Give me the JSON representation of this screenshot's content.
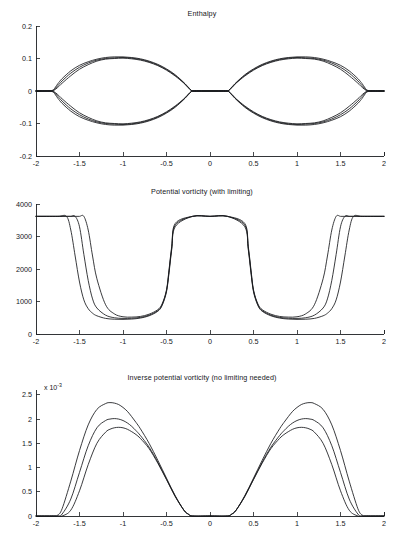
{
  "figure": {
    "background_color": "#ffffff",
    "line_color": "#16181b",
    "axis_color": "#1d1f22"
  },
  "panels": [
    {
      "id": "enthalpy",
      "title": "Enthalpy",
      "exponent_label": ""
    },
    {
      "id": "potential-vorticity",
      "title": "Potential vorticity (with limiting)",
      "exponent_label": ""
    },
    {
      "id": "inverse-potential-vorticity",
      "title": "Inverse potential vorticity (no limiting needed)",
      "exponent_label_prefix": "x 10",
      "exponent_label_sup": "-3"
    }
  ],
  "chart_data": [
    {
      "type": "line",
      "title": "Enthalpy",
      "xlabel": "",
      "ylabel": "",
      "xlim": [
        -2,
        2
      ],
      "ylim": [
        -0.2,
        0.2
      ],
      "xticks": [
        -2,
        -1.5,
        -1,
        -0.5,
        0,
        0.5,
        1,
        1.5,
        2
      ],
      "xticklabels": [
        "-2",
        "-1.5",
        "-1",
        "-0.5",
        "0",
        "0.5",
        "1",
        "1.5",
        "2"
      ],
      "yticks": [
        -0.2,
        -0.1,
        0,
        0.1,
        0.2
      ],
      "yticklabels": [
        "-0.2",
        "-0.1",
        "0",
        "0.1",
        "0.2"
      ],
      "grid": false,
      "legend": "none",
      "x": [
        -2,
        -1.9,
        -1.85,
        -1.8,
        -1.75,
        -1.7,
        -1.6,
        -1.5,
        -1.4,
        -1.3,
        -1.2,
        -1.1,
        -1,
        -0.9,
        -0.8,
        -0.7,
        -0.6,
        -0.5,
        -0.4,
        -0.3,
        -0.25,
        -0.2,
        -0.1,
        0,
        0.1,
        0.2,
        0.25,
        0.3,
        0.4,
        0.5,
        0.6,
        0.7,
        0.8,
        0.9,
        1,
        1.1,
        1.2,
        1.3,
        1.4,
        1.5,
        1.6,
        1.7,
        1.75,
        1.8,
        1.85,
        1.9,
        2
      ],
      "series": [
        {
          "name": "upper-branch-1",
          "values": [
            0,
            0,
            0,
            0.004,
            0.022,
            0.038,
            0.062,
            0.079,
            0.09,
            0.098,
            0.103,
            0.105,
            0.105,
            0.103,
            0.099,
            0.092,
            0.082,
            0.068,
            0.05,
            0.026,
            0.012,
            0,
            0,
            0,
            0,
            0,
            0.012,
            0.026,
            0.05,
            0.068,
            0.082,
            0.092,
            0.099,
            0.103,
            0.105,
            0.105,
            0.103,
            0.098,
            0.09,
            0.079,
            0.062,
            0.038,
            0.022,
            0.004,
            0,
            0,
            0
          ]
        },
        {
          "name": "upper-branch-2",
          "values": [
            0,
            0,
            0,
            0.002,
            0.016,
            0.031,
            0.055,
            0.073,
            0.086,
            0.095,
            0.1,
            0.102,
            0.103,
            0.101,
            0.097,
            0.09,
            0.08,
            0.066,
            0.048,
            0.025,
            0.011,
            0,
            0,
            0,
            0,
            0,
            0.011,
            0.025,
            0.048,
            0.066,
            0.08,
            0.09,
            0.097,
            0.101,
            0.103,
            0.102,
            0.1,
            0.095,
            0.086,
            0.073,
            0.055,
            0.031,
            0.016,
            0.002,
            0,
            0,
            0
          ]
        },
        {
          "name": "upper-branch-3",
          "values": [
            0,
            0,
            0,
            0.001,
            0.011,
            0.024,
            0.047,
            0.067,
            0.081,
            0.092,
            0.098,
            0.1,
            0.101,
            0.099,
            0.095,
            0.088,
            0.078,
            0.064,
            0.046,
            0.024,
            0.01,
            0,
            0,
            0,
            0,
            0,
            0.01,
            0.024,
            0.046,
            0.064,
            0.078,
            0.088,
            0.095,
            0.099,
            0.101,
            0.1,
            0.098,
            0.092,
            0.081,
            0.067,
            0.047,
            0.024,
            0.011,
            0.001,
            0,
            0,
            0
          ]
        },
        {
          "name": "lower-branch-1",
          "values": [
            0,
            0,
            0,
            -0.004,
            -0.022,
            -0.038,
            -0.062,
            -0.079,
            -0.09,
            -0.098,
            -0.103,
            -0.105,
            -0.105,
            -0.103,
            -0.099,
            -0.092,
            -0.082,
            -0.068,
            -0.05,
            -0.026,
            -0.012,
            0,
            0,
            0,
            0,
            0,
            -0.012,
            -0.026,
            -0.05,
            -0.068,
            -0.082,
            -0.092,
            -0.099,
            -0.103,
            -0.105,
            -0.105,
            -0.103,
            -0.098,
            -0.09,
            -0.079,
            -0.062,
            -0.038,
            -0.022,
            -0.004,
            0,
            0,
            0
          ]
        },
        {
          "name": "lower-branch-2",
          "values": [
            0,
            0,
            0,
            -0.002,
            -0.016,
            -0.031,
            -0.055,
            -0.073,
            -0.086,
            -0.095,
            -0.1,
            -0.102,
            -0.103,
            -0.101,
            -0.097,
            -0.09,
            -0.08,
            -0.066,
            -0.048,
            -0.025,
            -0.011,
            0,
            0,
            0,
            0,
            0,
            -0.011,
            -0.025,
            -0.048,
            -0.066,
            -0.08,
            -0.09,
            -0.097,
            -0.101,
            -0.103,
            -0.102,
            -0.1,
            -0.095,
            -0.086,
            -0.073,
            -0.055,
            -0.031,
            -0.016,
            -0.002,
            0,
            0,
            0
          ]
        },
        {
          "name": "lower-branch-3",
          "values": [
            0,
            0,
            0,
            -0.001,
            -0.011,
            -0.024,
            -0.047,
            -0.067,
            -0.081,
            -0.092,
            -0.098,
            -0.1,
            -0.101,
            -0.099,
            -0.095,
            -0.088,
            -0.078,
            -0.064,
            -0.046,
            -0.024,
            -0.01,
            0,
            0,
            0,
            0,
            0,
            -0.01,
            -0.024,
            -0.046,
            -0.064,
            -0.078,
            -0.088,
            -0.095,
            -0.099,
            -0.101,
            -0.1,
            -0.098,
            -0.092,
            -0.081,
            -0.067,
            -0.047,
            -0.024,
            -0.011,
            -0.001,
            0,
            0,
            0
          ]
        }
      ]
    },
    {
      "type": "line",
      "title": "Potential vorticity (with limiting)",
      "xlabel": "",
      "ylabel": "",
      "xlim": [
        -2,
        2
      ],
      "ylim": [
        0,
        4000
      ],
      "xticks": [
        -2,
        -1.5,
        -1,
        -0.5,
        0,
        0.5,
        1,
        1.5,
        2
      ],
      "xticklabels": [
        "-2",
        "-1.5",
        "-1",
        "-0.5",
        "0",
        "0.5",
        "1",
        "1.5",
        "2"
      ],
      "yticks": [
        0,
        1000,
        2000,
        3000,
        4000
      ],
      "yticklabels": [
        "0",
        "1000",
        "2000",
        "3000",
        "4000"
      ],
      "grid": false,
      "legend": "none",
      "limit_value": 3620,
      "x": [
        -2,
        -1.75,
        -1.65,
        -1.6,
        -1.55,
        -1.5,
        -1.45,
        -1.4,
        -1.35,
        -1.3,
        -1.2,
        -1.1,
        -1,
        -0.9,
        -0.8,
        -0.7,
        -0.6,
        -0.55,
        -0.5,
        -0.47,
        -0.44,
        -0.4,
        -0.2,
        0,
        0.2,
        0.4,
        0.44,
        0.47,
        0.5,
        0.55,
        0.6,
        0.7,
        0.8,
        0.9,
        1,
        1.1,
        1.2,
        1.3,
        1.35,
        1.4,
        1.45,
        1.5,
        1.55,
        1.6,
        1.65,
        1.75,
        2
      ],
      "series": [
        {
          "name": "pv-curve-1",
          "values": [
            3620,
            3620,
            3620,
            3200,
            2400,
            1600,
            1050,
            780,
            640,
            560,
            480,
            455,
            450,
            460,
            490,
            560,
            700,
            880,
            1300,
            1900,
            2600,
            3300,
            3620,
            3620,
            3620,
            3300,
            2600,
            1900,
            1300,
            880,
            700,
            560,
            490,
            460,
            450,
            455,
            480,
            560,
            640,
            780,
            1050,
            1600,
            2400,
            3200,
            3620,
            3620,
            3620
          ]
        },
        {
          "name": "pv-curve-2",
          "values": [
            3620,
            3620,
            3620,
            3620,
            3620,
            3300,
            2450,
            1650,
            1080,
            800,
            580,
            500,
            480,
            485,
            510,
            580,
            720,
            900,
            1330,
            1950,
            2650,
            3350,
            3620,
            3620,
            3620,
            3350,
            2650,
            1950,
            1330,
            900,
            720,
            580,
            510,
            485,
            480,
            500,
            580,
            800,
            1080,
            1650,
            2450,
            3300,
            3620,
            3620,
            3620,
            3620,
            3620
          ]
        },
        {
          "name": "pv-curve-3",
          "values": [
            3620,
            3620,
            3620,
            3620,
            3620,
            3620,
            3620,
            3200,
            2400,
            1700,
            900,
            620,
            530,
            520,
            540,
            610,
            750,
            930,
            1360,
            2000,
            2700,
            3400,
            3620,
            3620,
            3620,
            3400,
            2700,
            2000,
            1360,
            930,
            750,
            610,
            540,
            520,
            530,
            620,
            900,
            1700,
            2400,
            3200,
            3620,
            3620,
            3620,
            3620,
            3620,
            3620,
            3620
          ]
        }
      ]
    },
    {
      "type": "line",
      "title": "Inverse potential vorticity (no limiting needed)",
      "xlabel": "",
      "ylabel": "",
      "y_multiplier": "x 10^-3",
      "xlim": [
        -2,
        2
      ],
      "ylim": [
        0,
        2.6
      ],
      "xticks": [
        -2,
        -1.5,
        -1,
        -0.5,
        0,
        0.5,
        1,
        1.5,
        2
      ],
      "xticklabels": [
        "-2",
        "-1.5",
        "-1",
        "-0.5",
        "0",
        "0.5",
        "1",
        "1.5",
        "2"
      ],
      "yticks": [
        0,
        0.5,
        1,
        1.5,
        2,
        2.5
      ],
      "yticklabels": [
        "0",
        "0.5",
        "1",
        "1.5",
        "2",
        "2.5"
      ],
      "grid": false,
      "legend": "none",
      "x": [
        -2,
        -1.8,
        -1.75,
        -1.7,
        -1.6,
        -1.5,
        -1.4,
        -1.3,
        -1.2,
        -1.15,
        -1.1,
        -1.05,
        -1,
        -0.95,
        -0.9,
        -0.85,
        -0.8,
        -0.7,
        -0.6,
        -0.5,
        -0.4,
        -0.3,
        -0.25,
        -0.2,
        0,
        0.2,
        0.25,
        0.3,
        0.4,
        0.5,
        0.6,
        0.7,
        0.8,
        0.85,
        0.9,
        0.95,
        1,
        1.05,
        1.1,
        1.15,
        1.2,
        1.3,
        1.4,
        1.5,
        1.6,
        1.7,
        1.75,
        1.8,
        2
      ],
      "series": [
        {
          "name": "ipv-curve-tall",
          "values": [
            0,
            0,
            0.02,
            0.15,
            0.72,
            1.35,
            1.88,
            2.2,
            2.32,
            2.34,
            2.33,
            2.3,
            2.24,
            2.16,
            2.05,
            1.93,
            1.8,
            1.5,
            1.15,
            0.78,
            0.42,
            0.12,
            0.04,
            0,
            0,
            0,
            0.04,
            0.12,
            0.42,
            0.78,
            1.15,
            1.5,
            1.8,
            1.93,
            2.05,
            2.16,
            2.24,
            2.3,
            2.33,
            2.34,
            2.32,
            2.2,
            1.88,
            1.35,
            0.72,
            0.15,
            0.02,
            0,
            0
          ]
        },
        {
          "name": "ipv-curve-mid",
          "values": [
            0,
            0,
            0,
            0.04,
            0.35,
            0.9,
            1.45,
            1.82,
            1.97,
            2,
            2.01,
            2,
            1.97,
            1.92,
            1.85,
            1.76,
            1.66,
            1.42,
            1.11,
            0.76,
            0.41,
            0.12,
            0.04,
            0,
            0,
            0,
            0.04,
            0.12,
            0.41,
            0.76,
            1.11,
            1.42,
            1.66,
            1.76,
            1.85,
            1.92,
            1.97,
            2,
            2.01,
            2,
            1.97,
            1.82,
            1.45,
            0.9,
            0.35,
            0.04,
            0,
            0,
            0
          ]
        },
        {
          "name": "ipv-curve-low",
          "values": [
            0,
            0,
            0,
            0,
            0.12,
            0.52,
            1.06,
            1.5,
            1.73,
            1.79,
            1.82,
            1.83,
            1.82,
            1.79,
            1.74,
            1.68,
            1.6,
            1.39,
            1.09,
            0.75,
            0.4,
            0.12,
            0.04,
            0,
            0,
            0,
            0.04,
            0.12,
            0.4,
            0.75,
            1.09,
            1.39,
            1.6,
            1.68,
            1.74,
            1.79,
            1.82,
            1.83,
            1.82,
            1.79,
            1.73,
            1.5,
            1.06,
            0.52,
            0.12,
            0,
            0,
            0,
            0
          ]
        }
      ]
    }
  ]
}
